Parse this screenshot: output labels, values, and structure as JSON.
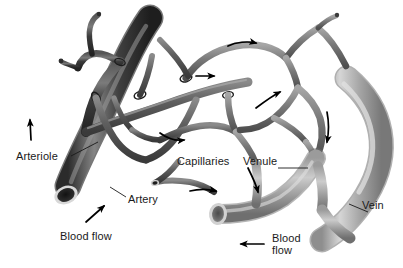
{
  "figure": {
    "background_color": "#ffffff",
    "text_color": "#1a1a1a",
    "artery_color": "#3a3a3a",
    "vein_color": "#a8a8a8",
    "capillary_color": "#6e6e6e"
  },
  "labels": {
    "arteriole": "Arteriole",
    "artery": "Artery",
    "capillaries": "Capillaries",
    "venule": "Venule",
    "vein": "Vein",
    "blood_flow_left": "Blood flow",
    "blood_flow_right_line1": "Blood",
    "blood_flow_right_line2": "flow"
  },
  "flow_arrows": [
    {
      "name": "artery-inflow-arrow",
      "direction": "up-right"
    },
    {
      "name": "arteriole-upward-arrow",
      "direction": "up"
    },
    {
      "name": "capillary-arrow-upper-right",
      "direction": "right"
    },
    {
      "name": "capillary-arrow-mid-right",
      "direction": "right"
    },
    {
      "name": "capillary-arrow-center",
      "direction": "right"
    },
    {
      "name": "capillary-arrow-lower-left",
      "direction": "right"
    },
    {
      "name": "capillary-arrow-bottom",
      "direction": "right"
    },
    {
      "name": "capillary-arrow-right-curve",
      "direction": "up-right"
    },
    {
      "name": "venule-downward-arrow",
      "direction": "down"
    },
    {
      "name": "vein-downward-arrow",
      "direction": "down"
    },
    {
      "name": "vein-outflow-arrow",
      "direction": "left"
    }
  ]
}
